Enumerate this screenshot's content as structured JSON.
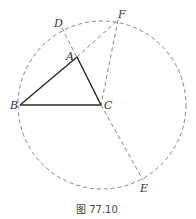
{
  "figure": {
    "caption": "图 77.10",
    "colors": {
      "solid": "#2a2a2a",
      "dashed": "#777777",
      "label": "#333333"
    },
    "circle": {
      "cx": 102,
      "cy": 105,
      "r": 84
    },
    "points": {
      "A": {
        "label": "A",
        "x": 77,
        "y": 57
      },
      "B": {
        "label": "B",
        "x": 20,
        "y": 105
      },
      "C": {
        "label": "C",
        "x": 101,
        "y": 105
      },
      "D": {
        "label": "D",
        "x": 62,
        "y": 28
      },
      "E": {
        "label": "E",
        "x": 143,
        "y": 180
      },
      "F": {
        "label": "F",
        "x": 118,
        "y": 20
      }
    },
    "solid_segments": [
      "AB",
      "BC",
      "CA"
    ],
    "dashed_segments": [
      "DA",
      "AF",
      "FC",
      "CE"
    ],
    "dashed_circle": "circumcircle through B, D, F, E"
  }
}
